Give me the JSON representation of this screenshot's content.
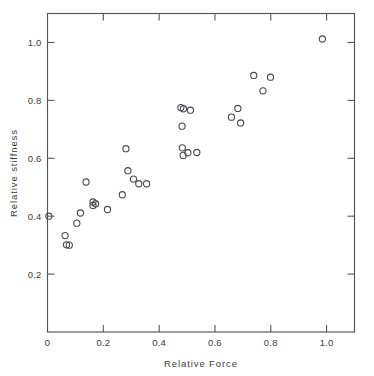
{
  "chart_data": {
    "type": "scatter",
    "title": "",
    "xlabel": "Relative Force",
    "ylabel": "Relative stiffness",
    "xlim": [
      0.0,
      1.1
    ],
    "ylim": [
      0.0,
      1.1
    ],
    "xticks": [
      0.0,
      0.2,
      0.4,
      0.6,
      0.8,
      1.0
    ],
    "xticklabels": [
      "0",
      "0.2",
      "0.4",
      "0.6",
      "0.8",
      "1.0"
    ],
    "yticks": [
      0.2,
      0.4,
      0.6,
      0.8,
      1.0
    ],
    "yticklabels": [
      "0.2",
      "0.4",
      "0.6",
      "0.8",
      "1.0"
    ],
    "grid": false,
    "legend": null,
    "marker": "open-circle",
    "marker_color": "#4a4b50",
    "frame": "box",
    "tick_direction": "in",
    "x": [
      0.005,
      0.063,
      0.068,
      0.078,
      0.105,
      0.118,
      0.138,
      0.163,
      0.163,
      0.172,
      0.215,
      0.268,
      0.281,
      0.288,
      0.308,
      0.327,
      0.355,
      0.478,
      0.482,
      0.483,
      0.486,
      0.487,
      0.503,
      0.512,
      0.535,
      0.659,
      0.682,
      0.692,
      0.739,
      0.772,
      0.799,
      0.985
    ],
    "y": [
      0.4,
      0.333,
      0.301,
      0.3,
      0.376,
      0.411,
      0.518,
      0.449,
      0.437,
      0.443,
      0.423,
      0.474,
      0.633,
      0.557,
      0.528,
      0.512,
      0.512,
      0.775,
      0.711,
      0.636,
      0.61,
      0.771,
      0.619,
      0.766,
      0.62,
      0.742,
      0.772,
      0.722,
      0.886,
      0.833,
      0.88,
      1.012
    ],
    "n_points": 32
  },
  "axes": {
    "x_title": "Relative Force",
    "y_title": "Relative stiffness"
  }
}
